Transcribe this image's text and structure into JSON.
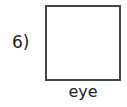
{
  "worksheet_item": {
    "number_label": "6)",
    "word": "eye",
    "box": {
      "content": "",
      "border_color": "#444444"
    }
  }
}
